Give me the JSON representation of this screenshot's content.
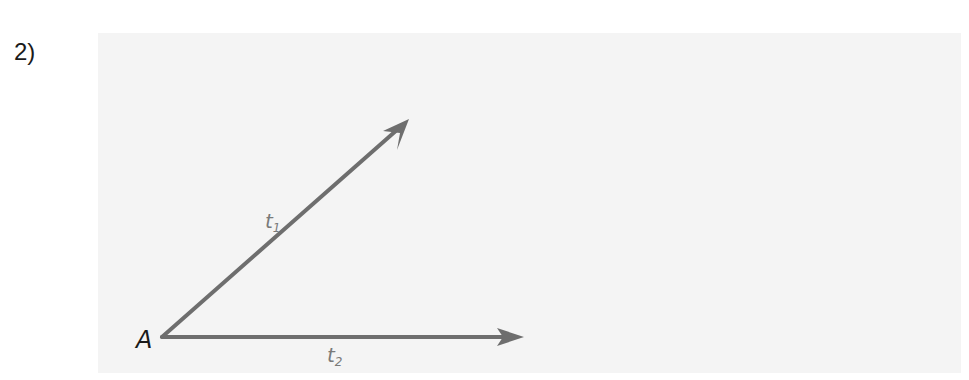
{
  "problem": {
    "number": "2)"
  },
  "diagram": {
    "vertex": {
      "label": "A",
      "x": 162,
      "y": 337
    },
    "rays": [
      {
        "name": "t1",
        "label_base": "t",
        "label_sub": "1",
        "tip": {
          "x": 409,
          "y": 119
        },
        "label_pos": {
          "x": 265,
          "y": 226
        }
      },
      {
        "name": "t2",
        "label_base": "t",
        "label_sub": "2",
        "tip": {
          "x": 524,
          "y": 337
        },
        "label_pos": {
          "x": 327,
          "y": 364
        }
      }
    ],
    "colors": {
      "ray": "#6e6e6e",
      "panel": "#f4f4f4",
      "text": "#1a1a1a"
    }
  }
}
